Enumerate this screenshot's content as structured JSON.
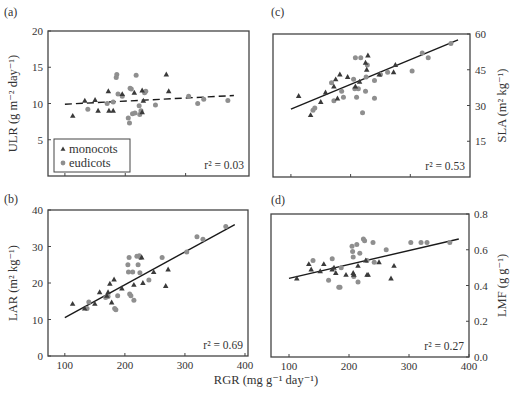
{
  "figure": {
    "shared_xlabel": "RGR (mg g⁻¹ day⁻¹)",
    "legend": {
      "entries": [
        {
          "label": "monocots",
          "marker": "triangle",
          "color": "#3a3a3a"
        },
        {
          "label": "eudicots",
          "marker": "circle",
          "color": "#8f8f8f"
        }
      ]
    },
    "colors": {
      "monocot": "#3a3a3a",
      "eudicot": "#8f8f8f",
      "line": "#1a1a1a",
      "axis": "#444444"
    }
  },
  "chart_data": [
    {
      "panel": "(a)",
      "type": "scatter",
      "title": "",
      "xlabel": "",
      "ylabel": "ULR (g m⁻² day⁻¹)",
      "ylabel_side": "left",
      "xlim": [
        72,
        405
      ],
      "ylim": [
        0,
        20
      ],
      "yticks": [
        5,
        10,
        15,
        20
      ],
      "xticks": [
        100,
        200,
        300
      ],
      "xticklabels_shown": false,
      "grid": false,
      "legend_position": "lower left",
      "fit": {
        "style": "dashed",
        "x": [
          100,
          380
        ],
        "y": [
          9.9,
          11.1
        ]
      },
      "r2_label": "r² = 0.03",
      "series": [
        {
          "name": "monocots",
          "points": [
            [
              113,
              8.3
            ],
            [
              133,
              10.4
            ],
            [
              150,
              10.5
            ],
            [
              155,
              9.0
            ],
            [
              172,
              11.7
            ],
            [
              173,
              9.0
            ],
            [
              180,
              9.0
            ],
            [
              195,
              11.3
            ],
            [
              215,
              11.5
            ],
            [
              228,
              11.8
            ],
            [
              230,
              10.4
            ],
            [
              228,
              8.8
            ],
            [
              268,
              14.0
            ],
            [
              272,
              11.7
            ]
          ]
        },
        {
          "name": "eudicots",
          "points": [
            [
              138,
              9.2
            ],
            [
              170,
              10.0
            ],
            [
              185,
              13.6
            ],
            [
              186,
              14.0
            ],
            [
              188,
              11.3
            ],
            [
              205,
              8.0
            ],
            [
              207,
              7.3
            ],
            [
              208,
              12.1
            ],
            [
              210,
              12.0
            ],
            [
              212,
              8.6
            ],
            [
              216,
              8.7
            ],
            [
              218,
              13.9
            ],
            [
              223,
              9.7
            ],
            [
              224,
              8.5
            ],
            [
              226,
              9.0
            ],
            [
              232,
              11.5
            ],
            [
              234,
              11.7
            ],
            [
              250,
              9.8
            ],
            [
              305,
              11.0
            ],
            [
              320,
              10.0
            ],
            [
              330,
              10.6
            ],
            [
              370,
              10.4
            ],
            [
              180,
              10.2
            ],
            [
              195,
              11.0
            ]
          ]
        }
      ]
    },
    {
      "panel": "(c)",
      "type": "scatter",
      "title": "",
      "xlabel": "",
      "ylabel": "SLA (m² kg⁻¹)",
      "ylabel_side": "right",
      "xlim": [
        70,
        400
      ],
      "ylim": [
        0,
        60
      ],
      "yticks": [
        15,
        30,
        45,
        60
      ],
      "xticks": [
        100,
        200,
        300
      ],
      "xticklabels_shown": false,
      "grid": false,
      "fit": {
        "style": "solid",
        "x": [
          100,
          380
        ],
        "y": [
          28.5,
          57.5
        ]
      },
      "r2_label": "r² = 0.53",
      "series": [
        {
          "name": "monocots",
          "points": [
            [
              113,
              34.0
            ],
            [
              133,
              26.0
            ],
            [
              150,
              31.5
            ],
            [
              158,
              35.5
            ],
            [
              172,
              38.0
            ],
            [
              175,
              41.0
            ],
            [
              178,
              33.0
            ],
            [
              182,
              43.0
            ],
            [
              195,
              42.0
            ],
            [
              208,
              38.0
            ],
            [
              215,
              40.0
            ],
            [
              225,
              48.0
            ],
            [
              227,
              45.0
            ],
            [
              229,
              51.0
            ],
            [
              248,
              43.0
            ],
            [
              272,
              44.0
            ],
            [
              275,
              47.0
            ]
          ]
        },
        {
          "name": "eudicots",
          "points": [
            [
              137,
              28.0
            ],
            [
              140,
              29.0
            ],
            [
              168,
              39.5
            ],
            [
              172,
              32.0
            ],
            [
              185,
              36.0
            ],
            [
              188,
              33.5
            ],
            [
              205,
              41.0
            ],
            [
              207,
              37.0
            ],
            [
              208,
              50.0
            ],
            [
              210,
              33.5
            ],
            [
              213,
              37.0
            ],
            [
              217,
              50.0
            ],
            [
              220,
              27.0
            ],
            [
              225,
              36.0
            ],
            [
              226,
              42.0
            ],
            [
              228,
              47.0
            ],
            [
              240,
              40.5
            ],
            [
              240,
              33.0
            ],
            [
              250,
              43.0
            ],
            [
              262,
              44.0
            ],
            [
              303,
              44.5
            ],
            [
              320,
              52.0
            ],
            [
              330,
              50.0
            ],
            [
              368,
              56.0
            ]
          ]
        }
      ]
    },
    {
      "panel": "(b)",
      "type": "scatter",
      "title": "",
      "xlabel": "RGR (mg g⁻¹ day⁻¹)",
      "ylabel": "LAR (m² kg⁻¹)",
      "ylabel_side": "left",
      "xlim": [
        72,
        405
      ],
      "ylim": [
        0,
        40
      ],
      "yticks": [
        0,
        10,
        20,
        30,
        40
      ],
      "xticks": [
        100,
        200,
        300,
        400
      ],
      "xticklabels_shown": true,
      "grid": false,
      "fit": {
        "style": "solid",
        "x": [
          100,
          383
        ],
        "y": [
          10.5,
          36.0
        ]
      },
      "r2_label": "r² = 0.69",
      "series": [
        {
          "name": "monocots",
          "points": [
            [
              113,
              14.3
            ],
            [
              133,
              13.0
            ],
            [
              150,
              14.3
            ],
            [
              158,
              17.5
            ],
            [
              170,
              16.5
            ],
            [
              172,
              17.5
            ],
            [
              175,
              19.8
            ],
            [
              178,
              14.7
            ],
            [
              182,
              21.0
            ],
            [
              195,
              18.5
            ],
            [
              215,
              19.5
            ],
            [
              228,
              27.0
            ],
            [
              230,
              20.0
            ],
            [
              248,
              23.0
            ],
            [
              268,
              19.2
            ],
            [
              272,
              23.7
            ]
          ]
        },
        {
          "name": "eudicots",
          "points": [
            [
              137,
              13.0
            ],
            [
              140,
              14.8
            ],
            [
              168,
              16.0
            ],
            [
              172,
              16.3
            ],
            [
              183,
              13.0
            ],
            [
              185,
              12.7
            ],
            [
              188,
              16.5
            ],
            [
              205,
              25.0
            ],
            [
              206,
              23.0
            ],
            [
              207,
              27.0
            ],
            [
              208,
              17.0
            ],
            [
              210,
              16.5
            ],
            [
              213,
              23.0
            ],
            [
              215,
              15.3
            ],
            [
              220,
              27.3
            ],
            [
              222,
              25.0
            ],
            [
              224,
              27.5
            ],
            [
              225,
              22.8
            ],
            [
              226,
              27.0
            ],
            [
              240,
              20.8
            ],
            [
              262,
              27.0
            ],
            [
              303,
              28.5
            ],
            [
              320,
              32.7
            ],
            [
              330,
              32.0
            ],
            [
              368,
              35.5
            ]
          ]
        }
      ]
    },
    {
      "panel": "(d)",
      "type": "scatter",
      "title": "",
      "xlabel": "RGR (mg g⁻¹ day⁻¹)",
      "ylabel": "LMF (g g⁻¹)",
      "ylabel_side": "right",
      "xlim": [
        70,
        400
      ],
      "ylim": [
        0.0,
        0.8
      ],
      "yticks": [
        0.0,
        0.2,
        0.4,
        0.6,
        0.8
      ],
      "ytick_labels": [
        "0.0",
        "0.2",
        "0.4",
        "0.6",
        "0.8"
      ],
      "xticks": [
        100,
        200,
        300,
        400
      ],
      "xticklabels_shown": true,
      "grid": false,
      "fit": {
        "style": "solid",
        "x": [
          100,
          383
        ],
        "y": [
          0.44,
          0.66
        ]
      },
      "r2_label": "r² = 0.27",
      "series": [
        {
          "name": "monocots",
          "points": [
            [
              113,
              0.44
            ],
            [
              133,
              0.52
            ],
            [
              137,
              0.49
            ],
            [
              152,
              0.48
            ],
            [
              158,
              0.52
            ],
            [
              172,
              0.49
            ],
            [
              175,
              0.5
            ],
            [
              178,
              0.47
            ],
            [
              195,
              0.46
            ],
            [
              207,
              0.47
            ],
            [
              208,
              0.46
            ],
            [
              215,
              0.51
            ],
            [
              228,
              0.54
            ],
            [
              230,
              0.46
            ],
            [
              232,
              0.46
            ],
            [
              250,
              0.53
            ],
            [
              270,
              0.44
            ],
            [
              275,
              0.51
            ]
          ]
        },
        {
          "name": "eudicots",
          "points": [
            [
              140,
              0.54
            ],
            [
              166,
              0.43
            ],
            [
              172,
              0.55
            ],
            [
              183,
              0.39
            ],
            [
              185,
              0.39
            ],
            [
              187,
              0.5
            ],
            [
              205,
              0.62
            ],
            [
              206,
              0.59
            ],
            [
              207,
              0.56
            ],
            [
              208,
              0.45
            ],
            [
              213,
              0.63
            ],
            [
              215,
              0.42
            ],
            [
              218,
              0.58
            ],
            [
              224,
              0.66
            ],
            [
              226,
              0.65
            ],
            [
              230,
              0.54
            ],
            [
              240,
              0.64
            ],
            [
              242,
              0.53
            ],
            [
              262,
              0.6
            ],
            [
              303,
              0.64
            ],
            [
              320,
              0.64
            ],
            [
              330,
              0.64
            ],
            [
              368,
              0.64
            ]
          ]
        }
      ]
    }
  ],
  "layout": {
    "panels": [
      {
        "left": 48,
        "top": 31,
        "right": 249,
        "bottom": 176,
        "label_x": 4,
        "label_y": 16,
        "ylabel_x": 14,
        "tick_side": "left"
      },
      {
        "left": 273,
        "top": 34,
        "right": 470,
        "bottom": 177,
        "label_x": 271,
        "label_y": 16,
        "ylabel_x": 503,
        "tick_side": "right"
      },
      {
        "left": 48,
        "top": 210,
        "right": 248,
        "bottom": 356,
        "label_x": 4,
        "label_y": 203,
        "ylabel_x": 14,
        "tick_side": "left"
      },
      {
        "left": 271,
        "top": 214,
        "right": 469,
        "bottom": 357,
        "label_x": 271,
        "label_y": 204,
        "ylabel_x": 503,
        "tick_side": "right"
      }
    ],
    "xlabel_pos": {
      "x": 266,
      "y": 384
    }
  }
}
